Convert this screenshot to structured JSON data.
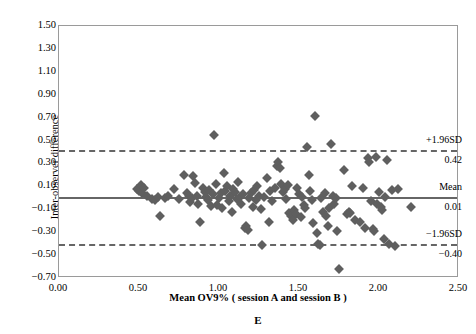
{
  "chart_data": {
    "type": "scatter",
    "title": "",
    "panel_label": "E",
    "xlabel": "Mean OV9% ( session A and session B )",
    "ylabel": "Inter-observer difference",
    "xlim": [
      0.0,
      2.5
    ],
    "ylim": [
      -0.7,
      1.5
    ],
    "xticks": [
      "0.00",
      "0.50",
      "1.00",
      "1.50",
      "2.00",
      "2.50"
    ],
    "xtick_values": [
      0.0,
      0.5,
      1.0,
      1.5,
      2.0,
      2.5
    ],
    "yticks": [
      "1.50",
      "1.30",
      "1.10",
      "0.90",
      "0.70",
      "0.50",
      "0.30",
      "0.10",
      "-0.10",
      "-0.30",
      "-0.50",
      "-0.70"
    ],
    "ytick_values": [
      1.5,
      1.3,
      1.1,
      0.9,
      0.7,
      0.5,
      0.3,
      0.1,
      -0.1,
      -0.3,
      -0.5,
      -0.7
    ],
    "grid": false,
    "legend": "none",
    "marker": "diamond",
    "marker_color": "#5f5f5f",
    "line_color": "#666666",
    "reference_lines": [
      {
        "name": "+1.96SD",
        "label": "+1.96SD",
        "value_label": "0.42",
        "value": 0.42,
        "style": "dashed"
      },
      {
        "name": "Mean",
        "label": "Mean",
        "value_label": "0.01",
        "value": 0.01,
        "style": "solid"
      },
      {
        "name": "-1.96SD",
        "label": "−1.96SD",
        "value_label": "−0.40",
        "value": -0.4,
        "style": "dashed"
      }
    ],
    "points": [
      [
        0.49,
        0.08
      ],
      [
        0.5,
        0.06
      ],
      [
        0.51,
        0.11
      ],
      [
        0.52,
        0.04
      ],
      [
        0.53,
        0.09
      ],
      [
        0.55,
        0.02
      ],
      [
        0.58,
        -0.01
      ],
      [
        0.6,
        -0.02
      ],
      [
        0.62,
        0.01
      ],
      [
        0.63,
        -0.16
      ],
      [
        0.66,
        0.0
      ],
      [
        0.68,
        0.02
      ],
      [
        0.72,
        0.08
      ],
      [
        0.75,
        -0.01
      ],
      [
        0.78,
        0.2
      ],
      [
        0.8,
        0.04
      ],
      [
        0.81,
        0.02
      ],
      [
        0.82,
        -0.04
      ],
      [
        0.83,
        0.0
      ],
      [
        0.84,
        0.19
      ],
      [
        0.85,
        0.13
      ],
      [
        0.86,
        0.02
      ],
      [
        0.87,
        -0.05
      ],
      [
        0.88,
        -0.21
      ],
      [
        0.9,
        0.09
      ],
      [
        0.91,
        0.05
      ],
      [
        0.92,
        0.01
      ],
      [
        0.93,
        -0.02
      ],
      [
        0.94,
        0.07
      ],
      [
        0.95,
        -0.07
      ],
      [
        0.96,
        0.03
      ],
      [
        0.97,
        0.55
      ],
      [
        0.98,
        0.12
      ],
      [
        0.99,
        -0.06
      ],
      [
        1.0,
        0.0
      ],
      [
        1.01,
        0.04
      ],
      [
        1.02,
        -0.09
      ],
      [
        1.03,
        0.22
      ],
      [
        1.04,
        0.06
      ],
      [
        1.05,
        0.1
      ],
      [
        1.06,
        -0.03
      ],
      [
        1.07,
        0.02
      ],
      [
        1.08,
        -0.12
      ],
      [
        1.09,
        0.08
      ],
      [
        1.1,
        0.05
      ],
      [
        1.11,
        -0.01
      ],
      [
        1.12,
        0.14
      ],
      [
        1.13,
        0.01
      ],
      [
        1.14,
        -0.05
      ],
      [
        1.15,
        0.03
      ],
      [
        1.16,
        -0.26
      ],
      [
        1.17,
        -0.25
      ],
      [
        1.18,
        -0.28
      ],
      [
        1.19,
        0.0
      ],
      [
        1.2,
        0.04
      ],
      [
        1.21,
        -0.08
      ],
      [
        1.22,
        0.07
      ],
      [
        1.23,
        -0.02
      ],
      [
        1.24,
        0.1
      ],
      [
        1.25,
        0.02
      ],
      [
        1.26,
        -0.1
      ],
      [
        1.27,
        -0.41
      ],
      [
        1.28,
        0.01
      ],
      [
        1.3,
        0.17
      ],
      [
        1.31,
        -0.21
      ],
      [
        1.32,
        0.06
      ],
      [
        1.33,
        -0.03
      ],
      [
        1.35,
        0.09
      ],
      [
        1.36,
        0.28
      ],
      [
        1.37,
        0.31
      ],
      [
        1.38,
        0.26
      ],
      [
        1.39,
        0.12
      ],
      [
        1.4,
        0.05
      ],
      [
        1.41,
        0.08
      ],
      [
        1.42,
        -0.01
      ],
      [
        1.43,
        0.11
      ],
      [
        1.44,
        -0.13
      ],
      [
        1.45,
        -0.16
      ],
      [
        1.46,
        -0.19
      ],
      [
        1.47,
        -0.11
      ],
      [
        1.48,
        -0.14
      ],
      [
        1.49,
        0.09
      ],
      [
        1.5,
        0.03
      ],
      [
        1.51,
        -0.17
      ],
      [
        1.52,
        0.01
      ],
      [
        1.53,
        -0.06
      ],
      [
        1.54,
        -0.09
      ],
      [
        1.55,
        0.44
      ],
      [
        1.56,
        0.2
      ],
      [
        1.57,
        0.06
      ],
      [
        1.58,
        -0.02
      ],
      [
        1.59,
        -0.22
      ],
      [
        1.6,
        0.71
      ],
      [
        1.61,
        -0.31
      ],
      [
        1.62,
        -0.4
      ],
      [
        1.63,
        -0.41
      ],
      [
        1.64,
        0.0
      ],
      [
        1.65,
        -0.12
      ],
      [
        1.66,
        0.04
      ],
      [
        1.67,
        -0.16
      ],
      [
        1.68,
        -0.25
      ],
      [
        1.69,
        -0.09
      ],
      [
        1.7,
        0.47
      ],
      [
        1.71,
        0.02
      ],
      [
        1.72,
        -0.05
      ],
      [
        1.73,
        0.0
      ],
      [
        1.74,
        -0.29
      ],
      [
        1.75,
        -0.62
      ],
      [
        1.78,
        0.24
      ],
      [
        1.8,
        -0.14
      ],
      [
        1.81,
        -0.12
      ],
      [
        1.82,
        -0.13
      ],
      [
        1.83,
        0.1
      ],
      [
        1.85,
        -0.19
      ],
      [
        1.88,
        -0.21
      ],
      [
        1.9,
        0.09
      ],
      [
        1.91,
        -0.26
      ],
      [
        1.93,
        0.35
      ],
      [
        1.94,
        0.31
      ],
      [
        1.95,
        -0.03
      ],
      [
        1.96,
        -0.27
      ],
      [
        1.97,
        -0.29
      ],
      [
        1.98,
        0.36
      ],
      [
        1.99,
        -0.05
      ],
      [
        2.0,
        0.05
      ],
      [
        2.01,
        -0.08
      ],
      [
        2.02,
        -0.11
      ],
      [
        2.03,
        -0.36
      ],
      [
        2.04,
        0.01
      ],
      [
        2.05,
        0.33
      ],
      [
        2.06,
        -0.4
      ],
      [
        2.08,
        0.07
      ],
      [
        2.1,
        -0.42
      ],
      [
        2.12,
        0.08
      ],
      [
        2.2,
        -0.08
      ]
    ]
  }
}
